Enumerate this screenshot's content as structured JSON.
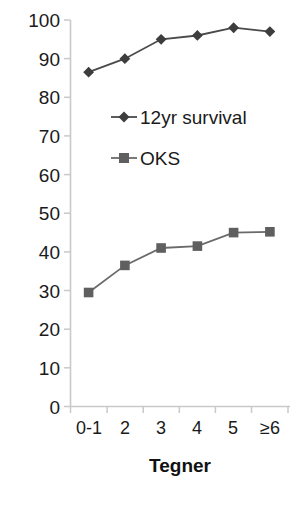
{
  "chart_data": {
    "type": "line",
    "title": "",
    "subtitle": "",
    "xlabel": "Tegner",
    "ylabel": "",
    "categories": [
      "0-1",
      "2",
      "3",
      "4",
      "5",
      "≥6"
    ],
    "series": [
      {
        "name": "12yr survival",
        "marker": "diamond",
        "color": "#3d3d3d",
        "values": [
          86.5,
          90,
          95,
          96,
          98,
          97
        ]
      },
      {
        "name": "OKS",
        "marker": "square",
        "color": "#5f5f5f",
        "values": [
          29.5,
          36.5,
          41,
          41.5,
          45,
          45.2
        ]
      }
    ],
    "ylim": [
      0,
      100
    ],
    "yticks": [
      0,
      10,
      20,
      30,
      40,
      50,
      60,
      70,
      80,
      90,
      100
    ],
    "ytick_labels": [
      "0",
      "10",
      "20",
      "30",
      "40",
      "50",
      "60",
      "70",
      "80",
      "90",
      "100"
    ],
    "grid": false,
    "legend_position": "inside-upper-center",
    "legend": [
      "12yr survival",
      "OKS"
    ],
    "axis_color": "#c8c8c8",
    "line_color_survival": "#4a4a4a",
    "line_color_oks": "#6a6a6a"
  },
  "yticks": {
    "t0": "0",
    "t10": "10",
    "t20": "20",
    "t30": "30",
    "t40": "40",
    "t50": "50",
    "t60": "60",
    "t70": "70",
    "t80": "80",
    "t90": "90",
    "t100": "100"
  },
  "xticks": {
    "c0": "0-1",
    "c1": "2",
    "c2": "3",
    "c3": "4",
    "c4": "5",
    "c5": "≥6"
  },
  "axis": {
    "x_title": "Tegner"
  },
  "legend": {
    "item1": "12yr survival",
    "item2": "OKS"
  }
}
